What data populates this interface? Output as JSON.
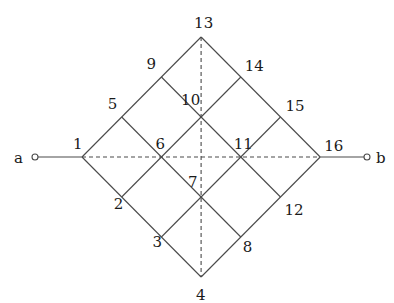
{
  "diagram": {
    "type": "grid-network",
    "grid_size": 4,
    "nodes": [
      {
        "id": "1",
        "label": "1"
      },
      {
        "id": "2",
        "label": "2"
      },
      {
        "id": "3",
        "label": "3"
      },
      {
        "id": "4",
        "label": "4"
      },
      {
        "id": "5",
        "label": "5"
      },
      {
        "id": "6",
        "label": "6"
      },
      {
        "id": "7",
        "label": "7"
      },
      {
        "id": "8",
        "label": "8"
      },
      {
        "id": "9",
        "label": "9"
      },
      {
        "id": "10",
        "label": "10"
      },
      {
        "id": "11",
        "label": "11"
      },
      {
        "id": "12",
        "label": "12"
      },
      {
        "id": "13",
        "label": "13"
      },
      {
        "id": "14",
        "label": "14"
      },
      {
        "id": "15",
        "label": "15"
      },
      {
        "id": "16",
        "label": "16"
      }
    ],
    "terminals": {
      "a": {
        "label": "a",
        "connects_to": "1"
      },
      "b": {
        "label": "b",
        "connects_to": "16"
      }
    },
    "dashed_lines": [
      {
        "from": "1",
        "to": "16",
        "orientation": "horizontal"
      },
      {
        "from": "13",
        "to": "4",
        "orientation": "vertical"
      }
    ]
  }
}
